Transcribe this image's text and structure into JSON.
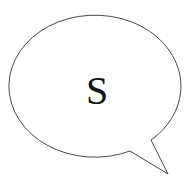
{
  "bubble": {
    "label": "S",
    "stroke_color": "#333333",
    "fill_color": "#ffffff"
  }
}
